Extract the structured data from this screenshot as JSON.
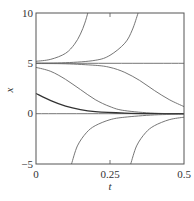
{
  "chart_data": {
    "type": "line",
    "title": "",
    "xlabel": "t",
    "ylabel": "x",
    "xlim": [
      0,
      0.5
    ],
    "ylim": [
      -5,
      10
    ],
    "grid": false,
    "legend": null,
    "x_ticks": [
      "0",
      "0.25",
      "0.5"
    ],
    "y_ticks": [
      "10",
      "5",
      "0",
      "−5"
    ],
    "series": [
      {
        "name": "equilibrium x=5",
        "x": [
          0,
          0.5
        ],
        "values": [
          5,
          5
        ]
      },
      {
        "name": "equilibrium x=0",
        "x": [
          0,
          0.5
        ],
        "values": [
          0,
          0
        ]
      },
      {
        "name": "x0=5.2 (blows up)",
        "x": [
          0,
          0.05,
          0.1,
          0.13,
          0.15,
          0.165,
          0.175
        ],
        "values": [
          5.2,
          5.4,
          6.0,
          6.9,
          7.9,
          9.0,
          10
        ]
      },
      {
        "name": "x0=5.02 (blows up)",
        "x": [
          0,
          0.1,
          0.2,
          0.25,
          0.3,
          0.325,
          0.345
        ],
        "values": [
          5.02,
          5.06,
          5.3,
          5.8,
          7.0,
          8.3,
          10
        ]
      },
      {
        "name": "x0=4.98",
        "x": [
          0,
          0.1,
          0.2,
          0.25,
          0.3,
          0.35,
          0.4,
          0.45,
          0.5
        ],
        "values": [
          4.98,
          4.95,
          4.8,
          4.6,
          4.1,
          3.3,
          2.3,
          1.4,
          0.7
        ]
      },
      {
        "name": "x0=4.6",
        "x": [
          0,
          0.05,
          0.1,
          0.15,
          0.2,
          0.25,
          0.3,
          0.4,
          0.5
        ],
        "values": [
          4.6,
          4.2,
          3.4,
          2.4,
          1.4,
          0.7,
          0.3,
          0.05,
          0.0
        ]
      },
      {
        "name": "x0=2",
        "x": [
          0,
          0.05,
          0.1,
          0.15,
          0.2,
          0.3,
          0.4,
          0.5
        ],
        "values": [
          2.0,
          1.3,
          0.75,
          0.4,
          0.2,
          0.05,
          0.0,
          0.0
        ]
      },
      {
        "name": "x0 negative (early)",
        "x": [
          0.12,
          0.14,
          0.17,
          0.2,
          0.25,
          0.3,
          0.4,
          0.5
        ],
        "values": [
          -5,
          -3.2,
          -1.9,
          -1.2,
          -0.6,
          -0.35,
          -0.12,
          -0.05
        ]
      },
      {
        "name": "x0 negative (late)",
        "x": [
          0.32,
          0.34,
          0.37,
          0.4,
          0.45,
          0.5
        ],
        "values": [
          -5,
          -3.2,
          -1.9,
          -1.2,
          -0.6,
          -0.35
        ]
      }
    ]
  },
  "axes": {
    "x_label": "t",
    "y_label": "x",
    "x_tick_labels": [
      "0",
      "0.25",
      "0.5"
    ],
    "y_tick_labels": [
      "10",
      "5",
      "0",
      "−5"
    ]
  }
}
